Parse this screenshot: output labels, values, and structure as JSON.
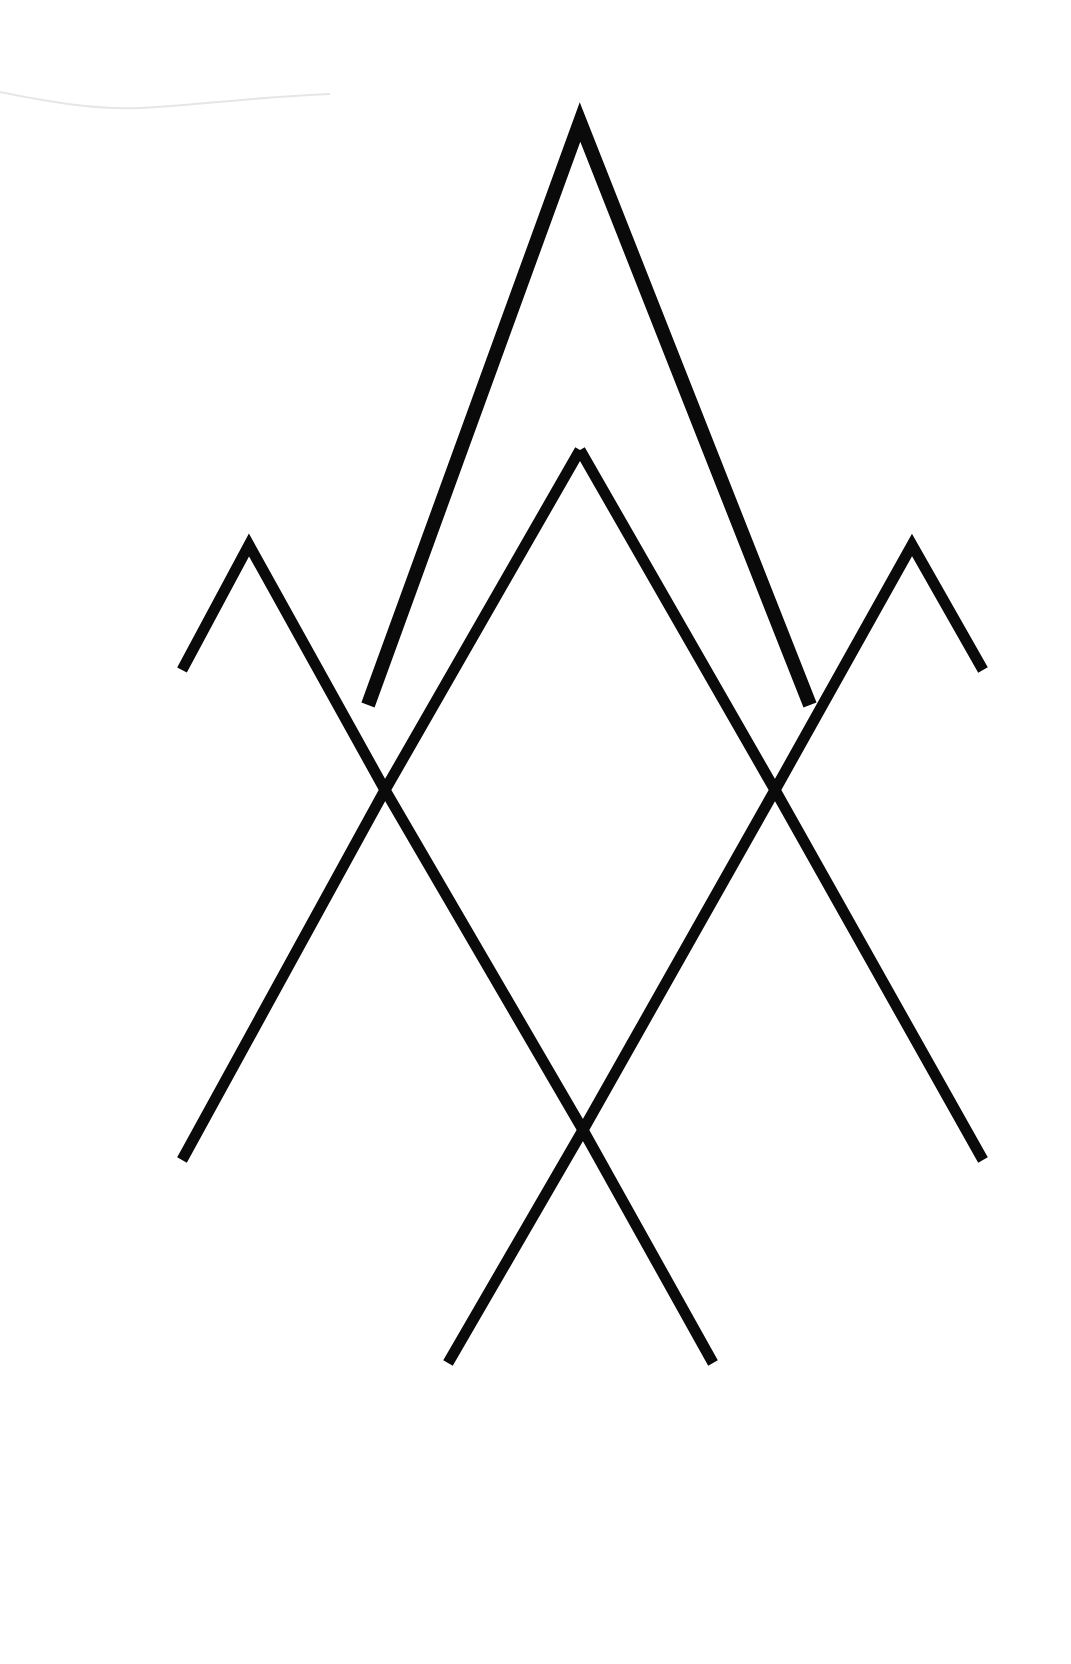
{
  "artwork": {
    "description": "Geometric line art of overlapping mountain peaks / chevrons",
    "background_color": "#ffffff",
    "stroke_color": "#0a0a0a",
    "canvas": {
      "width": 1071,
      "height": 1664
    },
    "shapes": [
      {
        "name": "tall-peak",
        "points": "368,705 580,122 810,705",
        "stroke_width": 14
      },
      {
        "name": "left-zigzag",
        "points": "182,670 249,545 385,790 182,1160",
        "stroke_width": 11
      },
      {
        "name": "right-zigzag",
        "points": "983,670 912,545 775,790 983,1160",
        "stroke_width": 11
      },
      {
        "name": "inner-peak-left-leg",
        "points": "580,450 385,790 583,1130 713,1363",
        "stroke_width": 11
      },
      {
        "name": "inner-peak-right-leg",
        "points": "580,450 775,790 583,1130 448,1363",
        "stroke_width": 11
      }
    ]
  }
}
